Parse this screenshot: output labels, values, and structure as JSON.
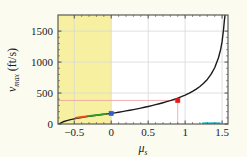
{
  "figure": {
    "background_color": "#fbfbf0",
    "plot_background_color": "#ffffff",
    "shaded_region_color": "#f7f0a0",
    "frame_color": "#4d4d4d",
    "grid_color": "#d8d8d8"
  },
  "axes": {
    "x_title_main": "μ",
    "x_title_sub": "s",
    "y_title_main": "v",
    "y_title_sub": "max",
    "y_title_units": "(ft/s)",
    "x_tick_labels": [
      "-0.5",
      "0",
      "0.5",
      "1",
      "1.5"
    ],
    "y_tick_labels": [
      "0",
      "500",
      "1000",
      "1500"
    ]
  },
  "chart_data": {
    "type": "line",
    "title": "",
    "xlabel": "μ_s",
    "ylabel": "v_max (ft/s)",
    "xlim": [
      -0.72,
      1.58
    ],
    "ylim": [
      0,
      1760
    ],
    "x_ticks": [
      -0.5,
      0,
      0.5,
      1,
      1.5
    ],
    "y_ticks": [
      0,
      500,
      1000,
      1500
    ],
    "grid": true,
    "legend": "none",
    "shaded_regions": [
      {
        "name": "unphysical-negative-mu-region",
        "color": "#f7f0a0",
        "x_start": -0.72,
        "x_end": 0.0
      }
    ],
    "series": [
      {
        "name": "v_max curve",
        "color": "#1a1a1a",
        "x": [
          -0.7,
          -0.68,
          -0.65,
          -0.6,
          -0.55,
          -0.5,
          -0.45,
          -0.4,
          -0.35,
          -0.3,
          -0.25,
          -0.2,
          -0.15,
          -0.1,
          -0.05,
          0.0,
          0.05,
          0.1,
          0.15,
          0.2,
          0.25,
          0.3,
          0.35,
          0.4,
          0.45,
          0.5,
          0.55,
          0.6,
          0.65,
          0.7,
          0.75,
          0.8,
          0.85,
          0.9,
          0.95,
          1.0,
          1.05,
          1.1,
          1.15,
          1.2,
          1.25,
          1.3,
          1.35,
          1.4,
          1.45,
          1.48,
          1.5,
          1.52,
          1.53,
          1.54
        ],
        "y": [
          0,
          18,
          36,
          55,
          70,
          83,
          95,
          105,
          115,
          124,
          133,
          141,
          149,
          157,
          164,
          171,
          180,
          190,
          200,
          211,
          222,
          233,
          245,
          257,
          270,
          283,
          297,
          312,
          327,
          343,
          360,
          378,
          398,
          419,
          442,
          467,
          495,
          527,
          563,
          606,
          657,
          720,
          800,
          908,
          1065,
          1200,
          1330,
          1530,
          1660,
          1755
        ]
      },
      {
        "name": "highlight-orange-segment",
        "color": "#f04a1a",
        "x": [
          -0.48,
          -0.44,
          -0.4,
          -0.36,
          -0.32
        ],
        "y": [
          97,
          106,
          113,
          120,
          126
        ]
      },
      {
        "name": "highlight-green-segment",
        "color": "#2f9e2f",
        "x": [
          -0.32,
          -0.26,
          -0.2,
          -0.14,
          -0.08
        ],
        "y": [
          126,
          134,
          142,
          150,
          159
        ]
      },
      {
        "name": "highlight-cyan-segment",
        "color": "#26c6d8",
        "x": [
          1.24,
          1.3,
          1.36,
          1.42,
          1.47
        ],
        "y": [
          14,
          14,
          14,
          14,
          14
        ]
      }
    ],
    "markers": [
      {
        "name": "blue-marker",
        "color": "#2f5fd0",
        "x": 0.0,
        "y": 171,
        "label": ""
      },
      {
        "name": "red-marker",
        "color": "#e01b1b",
        "x": 0.9,
        "y": 380,
        "label": ""
      }
    ],
    "marker_guides": [
      {
        "name": "red-marker-vertical-guide",
        "color": "#e8a0a0",
        "x": 0.9,
        "y_from": 0,
        "y_to": 380
      },
      {
        "name": "red-marker-horizontal-guide",
        "color": "#e8a0a0",
        "y": 380,
        "x_from": -0.72,
        "x_to": 0.9
      }
    ]
  }
}
